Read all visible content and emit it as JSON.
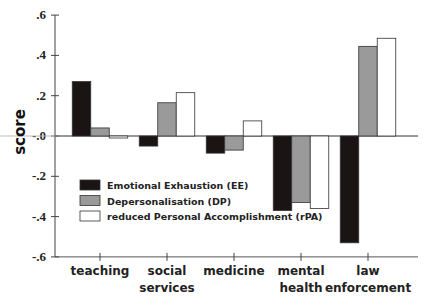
{
  "chart_data": {
    "type": "bar",
    "title": "",
    "xlabel": "",
    "ylabel": "score",
    "ylim": [
      -0.6,
      0.6
    ],
    "yticks": [
      0.6,
      0.4,
      0.2,
      0.0,
      -0.2,
      -0.4,
      -0.6
    ],
    "ytick_labels": [
      ".6",
      ".4",
      ".2",
      "-.0",
      "-.2",
      "-.4",
      "-.6"
    ],
    "grid": false,
    "legend_position": "lower-left inside plot",
    "categories": [
      "teaching",
      "social services",
      "medicine",
      "mental health",
      "law enforcement"
    ],
    "category_lines": [
      [
        "teaching"
      ],
      [
        "social",
        "services"
      ],
      [
        "medicine"
      ],
      [
        "mental",
        "health"
      ],
      [
        "law",
        "enforcement"
      ]
    ],
    "series": [
      {
        "name": "Emotional Exhaustion (EE)",
        "color": "#1a1414",
        "values": [
          0.27,
          -0.05,
          -0.085,
          -0.37,
          -0.53
        ]
      },
      {
        "name": "Depersonalisation (DP)",
        "color": "#9a9a9a",
        "values": [
          0.04,
          0.165,
          -0.07,
          -0.33,
          0.445
        ]
      },
      {
        "name": "reduced Personal Accomplishment (rPA)",
        "color": "#ffffff",
        "values": [
          -0.01,
          0.215,
          0.075,
          -0.36,
          0.485
        ]
      }
    ]
  }
}
